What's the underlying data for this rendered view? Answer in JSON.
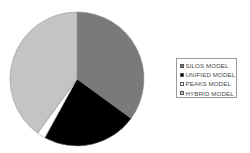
{
  "chart_data": {
    "type": "pie",
    "title": "",
    "start_angle_deg": 0,
    "direction": "clockwise",
    "categories": [
      "SILOS MODEL",
      "UNIFIED MODEL",
      "PEAKS MODEL",
      "HYBRID MODEL"
    ],
    "values": [
      35,
      23,
      2,
      40
    ],
    "colors": [
      "#7a7a7a",
      "#000000",
      "#ffffff",
      "#c4c4c4"
    ],
    "legend_position": "right",
    "geometry": {
      "cx": 77,
      "cy": 79,
      "r": 67
    }
  },
  "legend": {
    "items": [
      {
        "label": "SILOS MODEL",
        "color": "#7a7a7a"
      },
      {
        "label": "UNIFIED MODEL",
        "color": "#000000"
      },
      {
        "label": "PEAKS MODEL",
        "color": "#ffffff"
      },
      {
        "label": "HYBRID MODEL",
        "color": "#c4c4c4"
      }
    ]
  }
}
